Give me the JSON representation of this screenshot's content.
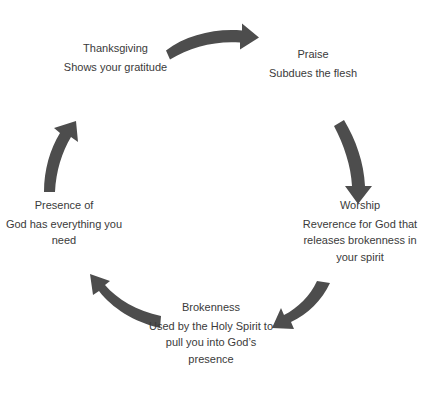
{
  "diagram": {
    "type": "cycle",
    "arrow_color": "#4d4d4d",
    "text_color": "#3a3a3a",
    "background": "#ffffff",
    "nodes": [
      {
        "id": "thanksgiving",
        "title": "Thanksgiving",
        "description": "Shows your gratitude",
        "position": "top-left"
      },
      {
        "id": "praise",
        "title": "Praise",
        "description": "Subdues the flesh",
        "position": "top-right"
      },
      {
        "id": "worship",
        "title": "Worship",
        "description": "Reverence for God that releases brokenness in your spirit",
        "position": "right"
      },
      {
        "id": "brokenness",
        "title": "Brokenness",
        "description": "Used by the Holy Spirit to pull you into God’s presence",
        "position": "bottom"
      },
      {
        "id": "presence",
        "title": "Presence of",
        "description": "God has everything you need",
        "position": "left"
      }
    ],
    "arrows": [
      {
        "id": "arrow-thanksgiving-to-praise",
        "from": "thanksgiving",
        "to": "praise",
        "icon": "curved-arrow-right-icon"
      },
      {
        "id": "arrow-praise-to-worship",
        "from": "praise",
        "to": "worship",
        "icon": "curved-arrow-down-icon"
      },
      {
        "id": "arrow-worship-to-brokenness",
        "from": "worship",
        "to": "brokenness",
        "icon": "curved-arrow-down-left-icon"
      },
      {
        "id": "arrow-brokenness-to-presence",
        "from": "brokenness",
        "to": "presence",
        "icon": "curved-arrow-up-left-icon"
      },
      {
        "id": "arrow-presence-to-thanksgiving",
        "from": "presence",
        "to": "thanksgiving",
        "icon": "curved-arrow-up-icon"
      }
    ]
  }
}
